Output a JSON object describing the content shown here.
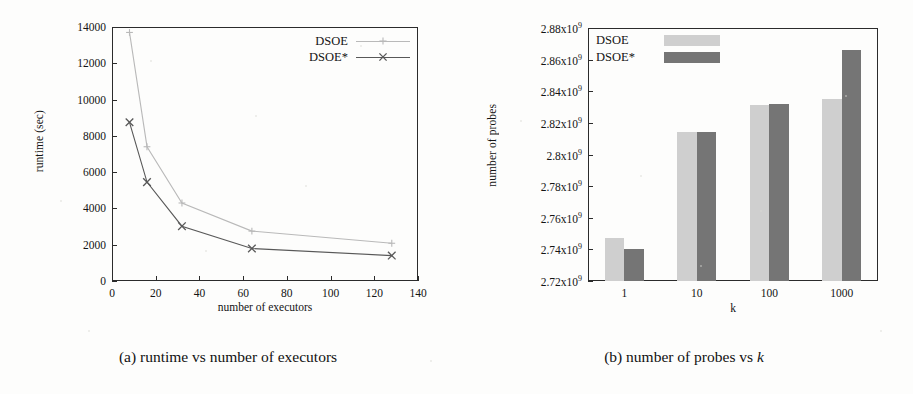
{
  "figure": {
    "panel_a": {
      "caption": "(a) runtime vs number of executors",
      "chart_data": {
        "type": "line",
        "title": "",
        "xlabel": "number of executors",
        "ylabel": "runtime (sec)",
        "xlim": [
          0,
          140
        ],
        "ylim": [
          0,
          14000
        ],
        "xticks": [
          "0",
          "20",
          "40",
          "60",
          "80",
          "100",
          "120",
          "140"
        ],
        "xtick_values": [
          0,
          20,
          40,
          60,
          80,
          100,
          120,
          140
        ],
        "yticks": [
          "0",
          "2000",
          "4000",
          "6000",
          "8000",
          "10000",
          "12000",
          "14000"
        ],
        "ytick_values": [
          0,
          2000,
          4000,
          6000,
          8000,
          10000,
          12000,
          14000
        ],
        "grid": false,
        "legend_position": "top-right",
        "x": [
          8,
          16,
          32,
          64,
          128
        ],
        "series": [
          {
            "name": "DSOE",
            "marker": "plus",
            "color": "#b9b9b9",
            "values": [
              13700,
              7400,
              4300,
              2750,
              2080
            ]
          },
          {
            "name": "DSOE*",
            "marker": "cross",
            "color": "#585858",
            "values": [
              8750,
              5450,
              3020,
              1790,
              1400
            ]
          }
        ]
      }
    },
    "panel_b": {
      "caption_prefix": "(b) number of probes vs ",
      "caption_italic": "k",
      "chart_data": {
        "type": "bar",
        "title": "",
        "xlabel": "k",
        "ylabel": "number of probes",
        "categories": [
          "1",
          "10",
          "100",
          "1000"
        ],
        "ylim": [
          2720000000,
          2880000000
        ],
        "yticks": [
          "2.72x10⁹",
          "2.74x10⁹",
          "2.76x10⁹",
          "2.78x10⁹",
          "2.8x10⁹",
          "2.82x10⁹",
          "2.84x10⁹",
          "2.86x10⁹",
          "2.88x10⁹"
        ],
        "ytick_mantissas": [
          "2.72",
          "2.74",
          "2.76",
          "2.78",
          "2.8",
          "2.82",
          "2.84",
          "2.86",
          "2.88"
        ],
        "ytick_values": [
          2720000000,
          2740000000,
          2760000000,
          2780000000,
          2800000000,
          2820000000,
          2840000000,
          2860000000,
          2880000000
        ],
        "exponent": "9",
        "base_label": "x10",
        "grid": false,
        "legend_position": "top-left",
        "series": [
          {
            "name": "DSOE",
            "color": "#cfcfcf",
            "values": [
              2747000000,
              2814000000,
              2831000000,
              2835000000
            ]
          },
          {
            "name": "DSOE*",
            "color": "#757575",
            "values": [
              2740000000,
              2814000000,
              2832000000,
              2866000000
            ]
          }
        ]
      }
    }
  }
}
